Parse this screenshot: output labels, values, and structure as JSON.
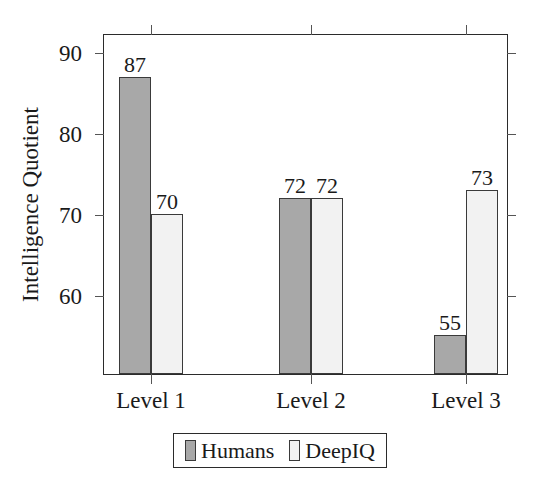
{
  "chart_data": {
    "type": "bar",
    "title": "",
    "xlabel": "",
    "ylabel": "Intelligence Quotient",
    "categories": [
      "Level 1",
      "Level 2",
      "Level 3"
    ],
    "series": [
      {
        "name": "Humans",
        "values": [
          87,
          72,
          55
        ],
        "color": "#a8a8a8"
      },
      {
        "name": "DeepIQ",
        "values": [
          70,
          72,
          73
        ],
        "color": "#f2f2f2"
      }
    ],
    "ylim": [
      50.1,
      92.2
    ],
    "yticks": [
      60,
      70,
      80,
      90
    ],
    "ytick_labels": [
      "60",
      "70",
      "80",
      "90"
    ],
    "grid": false,
    "legend_position": "below-axis-center",
    "bar_value_labels": [
      {
        "category": "Level 1",
        "series": "Humans",
        "label": "87"
      },
      {
        "category": "Level 1",
        "series": "DeepIQ",
        "label": "70"
      },
      {
        "category": "Level 2",
        "series": "Humans",
        "label": "72"
      },
      {
        "category": "Level 2",
        "series": "DeepIQ",
        "label": "72"
      },
      {
        "category": "Level 3",
        "series": "Humans",
        "label": "55"
      },
      {
        "category": "Level 3",
        "series": "DeepIQ",
        "label": "73"
      }
    ]
  },
  "axis": {
    "y_title": "Intelligence Quotient",
    "y_tick_labels": [
      "90",
      "80",
      "70",
      "60"
    ],
    "x_tick_labels": [
      "Level 1",
      "Level 2",
      "Level 3"
    ]
  },
  "legend": {
    "entries": [
      {
        "label": "Humans",
        "color": "#a8a8a8"
      },
      {
        "label": "DeepIQ",
        "color": "#f2f2f2"
      }
    ]
  },
  "colors": {
    "humans": "#a8a8a8",
    "deepiq": "#f2f2f2",
    "axis": "#2b2b2b",
    "text": "#1a1a1a"
  }
}
